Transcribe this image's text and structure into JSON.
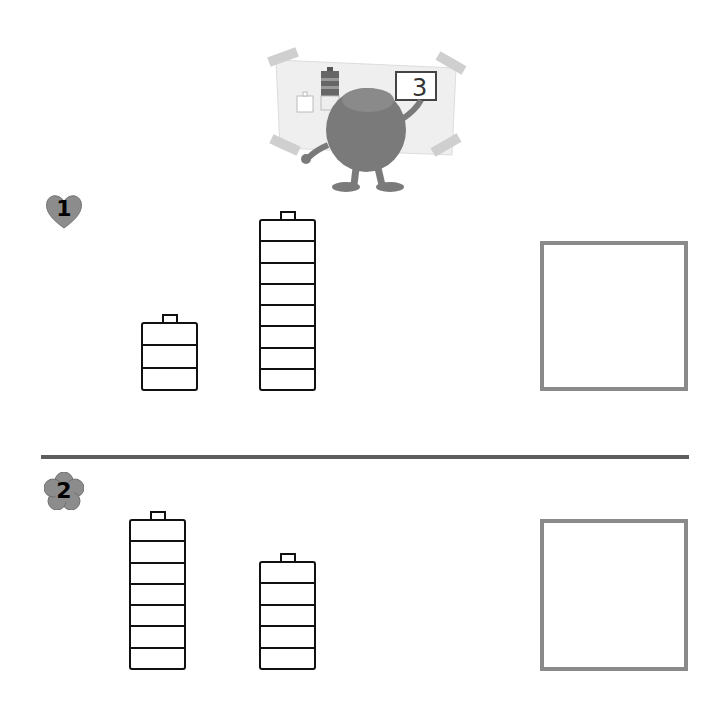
{
  "illustration": {
    "board_number": "3",
    "board_small_battery_cells": 3,
    "board_large_battery_cells": 6,
    "description": "fuzzy monster writing on a whiteboard"
  },
  "problems": [
    {
      "number": "1",
      "badge_shape": "heart",
      "batteries": [
        {
          "cells": 3,
          "x": 141,
          "top": 314,
          "width": 57,
          "bottom": 390
        },
        {
          "cells": 8,
          "x": 259,
          "top": 211,
          "width": 57,
          "bottom": 390
        }
      ],
      "answer_box": {
        "x": 540,
        "y": 241,
        "w": 148,
        "h": 150,
        "value": ""
      }
    },
    {
      "number": "2",
      "badge_shape": "flower",
      "batteries": [
        {
          "cells": 7,
          "x": 129,
          "top": 511,
          "width": 57,
          "bottom": 669
        },
        {
          "cells": 5,
          "x": 259,
          "top": 553,
          "width": 57,
          "bottom": 669
        }
      ],
      "answer_box": {
        "x": 540,
        "y": 519,
        "w": 148,
        "h": 152,
        "value": ""
      }
    }
  ],
  "colors": {
    "line": "#111111",
    "answer_box_border": "#8a8a8a",
    "divider": "#5e5e5e",
    "badge_fill": "#8c8c8c"
  }
}
